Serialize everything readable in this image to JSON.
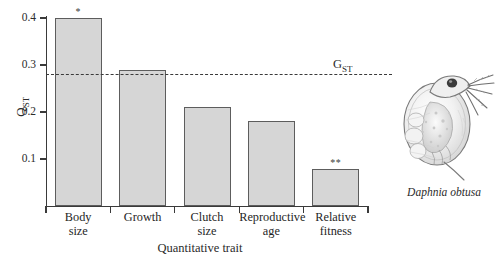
{
  "chart_data": {
    "type": "bar",
    "title": "",
    "xlabel": "Quantitative trait",
    "ylabel": "Q_ST",
    "ylabel_base": "Q",
    "ylabel_sub": "ST",
    "categories": [
      "Body size",
      "Growth",
      "Clutch size",
      "Reproductive age",
      "Relative fitness"
    ],
    "category_lines": [
      [
        "Body",
        "size"
      ],
      [
        "Growth",
        ""
      ],
      [
        "Clutch",
        "size"
      ],
      [
        "Reproductive",
        "age"
      ],
      [
        "Relative",
        "fitness"
      ]
    ],
    "values": [
      0.4,
      0.289,
      0.21,
      0.181,
      0.078
    ],
    "significance": [
      "*",
      "",
      "",
      "",
      "**"
    ],
    "ylim": [
      0.0,
      0.42
    ],
    "yticks": [
      0.4,
      0.3,
      0.2,
      0.1
    ],
    "ytick_labels": [
      "0.4",
      "0.3",
      "0.2",
      "0.1"
    ],
    "grid": false,
    "legend": "none",
    "reference_line": {
      "value": 0.28,
      "label": "G_ST",
      "label_base": "G",
      "label_sub": "ST",
      "style": "dashed"
    },
    "colors": {
      "bar_fill": "#d6d6d6",
      "bar_stroke": "#5d5d5d",
      "axis": "#3a3a3a",
      "text": "#2b2b2b",
      "background": "#ffffff"
    }
  },
  "illustration": {
    "caption": "Daphnia obtusa",
    "subject": "daphnia-water-flea"
  }
}
